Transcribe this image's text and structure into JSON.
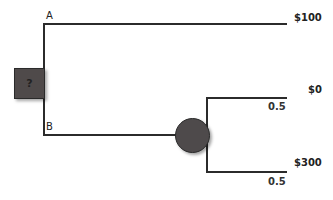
{
  "diagram": {
    "type": "decision-tree",
    "decision_node": {
      "symbol": "?"
    },
    "branches": [
      {
        "label": "A",
        "payoff": "$100"
      },
      {
        "label": "B",
        "chance_outcomes": [
          {
            "payoff": "$0",
            "probability": "0.5"
          },
          {
            "payoff": "$300",
            "probability": "0.5"
          }
        ]
      }
    ],
    "colors": {
      "node_fill": "#4f4a4a",
      "line": "#2b2b2b",
      "background": "#ffffff"
    }
  }
}
